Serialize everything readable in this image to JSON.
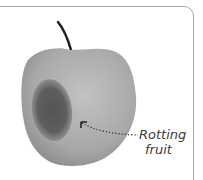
{
  "illustration": {
    "subject": "apple",
    "annotation": {
      "line1": "Rotting",
      "line2": "fruit"
    },
    "colors": {
      "apple_body": "#a9a9a9",
      "rot_spot": "#5f5f5f",
      "stem": "#1e1e1e",
      "frame": "#a8a8a8",
      "label": "#3a3a3a"
    }
  }
}
